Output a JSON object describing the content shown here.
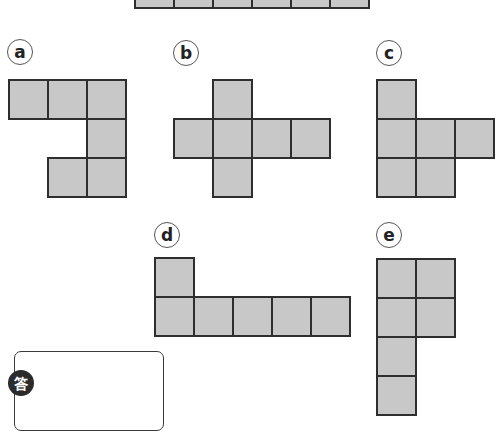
{
  "problem": {
    "reference_strip": {
      "cells": 6,
      "x": 134,
      "y": -32,
      "cell_size": 39
    },
    "options": [
      {
        "label": "a",
        "label_pos": [
          7,
          39
        ],
        "origin": [
          8,
          79
        ],
        "cells": [
          [
            0,
            0
          ],
          [
            1,
            0
          ],
          [
            2,
            0
          ],
          [
            2,
            1
          ],
          [
            1,
            2
          ],
          [
            2,
            2
          ]
        ]
      },
      {
        "label": "b",
        "label_pos": [
          173,
          40
        ],
        "origin": [
          173,
          79
        ],
        "cells": [
          [
            1,
            0
          ],
          [
            0,
            1
          ],
          [
            1,
            1
          ],
          [
            2,
            1
          ],
          [
            3,
            1
          ],
          [
            1,
            2
          ]
        ]
      },
      {
        "label": "c",
        "label_pos": [
          376,
          40
        ],
        "origin": [
          376,
          79
        ],
        "cells": [
          [
            0,
            0
          ],
          [
            0,
            1
          ],
          [
            1,
            1
          ],
          [
            2,
            1
          ],
          [
            0,
            2
          ],
          [
            1,
            2
          ]
        ]
      },
      {
        "label": "d",
        "label_pos": [
          154,
          222
        ],
        "origin": [
          154,
          257
        ],
        "cells": [
          [
            0,
            0
          ],
          [
            0,
            1
          ],
          [
            1,
            1
          ],
          [
            2,
            1
          ],
          [
            3,
            1
          ],
          [
            4,
            1
          ]
        ]
      },
      {
        "label": "e",
        "label_pos": [
          376,
          222
        ],
        "origin": [
          376,
          258
        ],
        "cells": [
          [
            0,
            0
          ],
          [
            1,
            0
          ],
          [
            0,
            1
          ],
          [
            1,
            1
          ],
          [
            0,
            2
          ],
          [
            0,
            3
          ]
        ]
      }
    ],
    "cell_size": 39,
    "colors": {
      "fill": "#c8c8c8",
      "stroke": "#2e2e2e"
    }
  },
  "answer": {
    "badge": "答"
  }
}
